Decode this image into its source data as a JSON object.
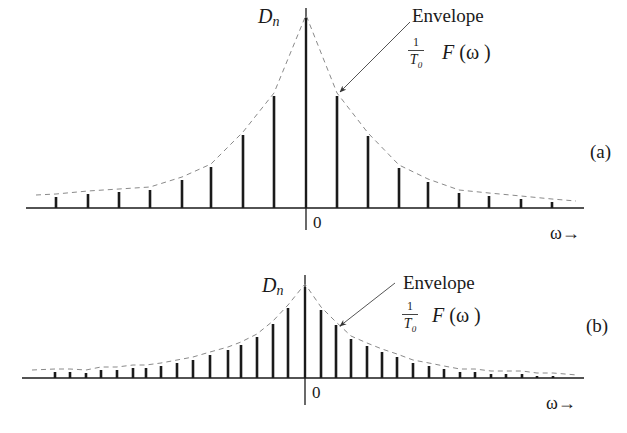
{
  "panels": [
    {
      "id": "a",
      "tag": "(a)",
      "ylabel": "D",
      "ylabel_sub": "n",
      "envelope_label": "Envelope",
      "envelope_formula": {
        "num": "1",
        "den": "T",
        "den_sub": "0",
        "func": "F",
        "arg": "(ω )"
      },
      "origin_label": "0",
      "xaxis_label": "ω→",
      "axis": {
        "x0": 26,
        "x1": 584,
        "y": 208
      },
      "center_x": 306,
      "vline_top": 8,
      "vline_bottom": 230,
      "bars": [
        {
          "x": 56,
          "top": 197
        },
        {
          "x": 88,
          "top": 194
        },
        {
          "x": 119,
          "top": 192
        },
        {
          "x": 150,
          "top": 190
        },
        {
          "x": 182,
          "top": 180
        },
        {
          "x": 211,
          "top": 167
        },
        {
          "x": 243,
          "top": 135
        },
        {
          "x": 274,
          "top": 96
        },
        {
          "x": 306,
          "top": 18
        },
        {
          "x": 337,
          "top": 96
        },
        {
          "x": 368,
          "top": 136
        },
        {
          "x": 399,
          "top": 168
        },
        {
          "x": 428,
          "top": 182
        },
        {
          "x": 459,
          "top": 193
        },
        {
          "x": 489,
          "top": 196
        },
        {
          "x": 521,
          "top": 199
        },
        {
          "x": 552,
          "top": 202
        }
      ],
      "arrow": {
        "x1": 410,
        "y1": 22,
        "x2": 340,
        "y2": 92
      }
    },
    {
      "id": "b",
      "tag": "(b)",
      "ylabel": "D",
      "ylabel_sub": "n",
      "envelope_label": "Envelope",
      "envelope_formula": {
        "num": "1",
        "den": "T",
        "den_sub": "0",
        "func": "F",
        "arg": "(ω )"
      },
      "origin_label": "0",
      "xaxis_label": "ω→",
      "axis": {
        "x0": 22,
        "x1": 584,
        "y": 378
      },
      "center_x": 305,
      "vline_top": 275,
      "vline_bottom": 405,
      "bars": [
        {
          "x": 55,
          "top": 372
        },
        {
          "x": 70,
          "top": 372
        },
        {
          "x": 86,
          "top": 373
        },
        {
          "x": 101,
          "top": 370
        },
        {
          "x": 117,
          "top": 370
        },
        {
          "x": 133,
          "top": 368
        },
        {
          "x": 146,
          "top": 368
        },
        {
          "x": 161,
          "top": 366
        },
        {
          "x": 177,
          "top": 363
        },
        {
          "x": 193,
          "top": 360
        },
        {
          "x": 210,
          "top": 355
        },
        {
          "x": 228,
          "top": 350
        },
        {
          "x": 241,
          "top": 345
        },
        {
          "x": 257,
          "top": 337
        },
        {
          "x": 273,
          "top": 324
        },
        {
          "x": 288,
          "top": 308
        },
        {
          "x": 305,
          "top": 287
        },
        {
          "x": 321,
          "top": 310
        },
        {
          "x": 336,
          "top": 325
        },
        {
          "x": 351,
          "top": 339
        },
        {
          "x": 367,
          "top": 346
        },
        {
          "x": 382,
          "top": 352
        },
        {
          "x": 397,
          "top": 357
        },
        {
          "x": 413,
          "top": 363
        },
        {
          "x": 429,
          "top": 366
        },
        {
          "x": 444,
          "top": 369
        },
        {
          "x": 460,
          "top": 372
        },
        {
          "x": 475,
          "top": 372
        },
        {
          "x": 491,
          "top": 374
        },
        {
          "x": 506,
          "top": 374
        },
        {
          "x": 522,
          "top": 374
        },
        {
          "x": 537,
          "top": 376
        },
        {
          "x": 553,
          "top": 376
        }
      ],
      "arrow": {
        "x1": 395,
        "y1": 283,
        "x2": 340,
        "y2": 326
      }
    }
  ],
  "colors": {
    "ink": "#1a1a1a",
    "envelope": "#8a8a8a",
    "arrow": "#555555"
  }
}
